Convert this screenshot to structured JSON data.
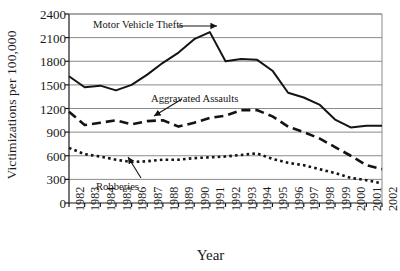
{
  "chart_data": {
    "type": "line",
    "title": "",
    "xlabel": "Year",
    "ylabel": "Victimizations per 100,000",
    "ylim": [
      0,
      2400
    ],
    "ytick_step": 300,
    "grid": true,
    "legend_position": "inline-annotations",
    "x": [
      1982,
      1983,
      1984,
      1985,
      1986,
      1987,
      1988,
      1989,
      1990,
      1991,
      1992,
      1993,
      1994,
      1995,
      1996,
      1997,
      1998,
      1999,
      2000,
      2001,
      2002
    ],
    "yticks": [
      "0",
      "300",
      "600",
      "900",
      "1200",
      "1500",
      "1800",
      "2100",
      "2400"
    ],
    "xticks": [
      "1982",
      "1983",
      "1984",
      "1985",
      "1986",
      "1987",
      "1988",
      "1989",
      "1990",
      "1991",
      "1992",
      "1993",
      "1994",
      "1995",
      "1996",
      "1997",
      "1998",
      "1999",
      "2000",
      "2001",
      "2002"
    ],
    "series": [
      {
        "name": "Motor Vehicle Thefts",
        "style": "solid",
        "color": "#141414",
        "values": [
          1610,
          1470,
          1490,
          1430,
          1500,
          1630,
          1780,
          1910,
          2080,
          2170,
          1800,
          1830,
          1820,
          1680,
          1400,
          1340,
          1250,
          1060,
          960,
          980,
          980
        ]
      },
      {
        "name": "Aggravated Assaults",
        "style": "dashed",
        "color": "#141414",
        "values": [
          1160,
          990,
          1020,
          1050,
          1000,
          1040,
          1050,
          970,
          1020,
          1080,
          1110,
          1180,
          1180,
          1100,
          970,
          900,
          820,
          710,
          600,
          480,
          430
        ]
      },
      {
        "name": "Robberies",
        "style": "dotted",
        "color": "#141414",
        "values": [
          700,
          620,
          590,
          550,
          520,
          530,
          550,
          550,
          570,
          580,
          590,
          610,
          630,
          560,
          510,
          480,
          430,
          380,
          320,
          290,
          250
        ]
      }
    ],
    "annotations": [
      {
        "label": "Motor Vehicle Thefts",
        "points_to_series": "Motor Vehicle Thefts"
      },
      {
        "label": "Aggravated Assaults",
        "points_to_series": "Aggravated Assaults"
      },
      {
        "label": "Robberies",
        "points_to_series": "Robberies"
      }
    ]
  }
}
